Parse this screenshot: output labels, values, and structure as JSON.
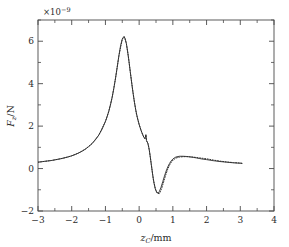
{
  "chart_data": {
    "type": "line",
    "title": "",
    "xlabel": "z_C/mm",
    "xlabel_parts": {
      "var": "z",
      "sub": "C",
      "unit": "/mm"
    },
    "ylabel": "F_z/N",
    "ylabel_parts": {
      "var": "F",
      "sub": "z",
      "unit": "/N"
    },
    "y_exponent_label": "×10⁻⁹",
    "y_exponent_parts": {
      "times": "×",
      "base": "10",
      "exp": "−9"
    },
    "xlim": [
      -3,
      4
    ],
    "ylim": [
      -2,
      7
    ],
    "xticks": [
      -3,
      -2,
      -1,
      0,
      1,
      2,
      3,
      4
    ],
    "xticklabels": [
      "−3",
      "−2",
      "−1",
      "0",
      "1",
      "2",
      "3",
      "4"
    ],
    "yticks": [
      -2,
      0,
      2,
      4,
      6
    ],
    "yticklabels": [
      "−2",
      "0",
      "2",
      "4",
      "6"
    ],
    "x_minor_ticks": [
      -2.5,
      -1.5,
      -0.5,
      0.5,
      1.5,
      2.5,
      3.5
    ],
    "y_minor_ticks": [
      -1,
      1,
      3,
      5,
      7
    ],
    "grid": false,
    "legend": "none",
    "annotations": [
      {
        "text": "small V-shaped notch artifact on descending branch",
        "x": 0.2,
        "y": 1.45
      }
    ],
    "series": [
      {
        "name": "solid",
        "style": "solid",
        "color": "#3a3a3a",
        "x": [
          -3.0,
          -2.9,
          -2.8,
          -2.7,
          -2.6,
          -2.5,
          -2.4,
          -2.3,
          -2.2,
          -2.1,
          -2.0,
          -1.9,
          -1.8,
          -1.7,
          -1.6,
          -1.5,
          -1.4,
          -1.3,
          -1.2,
          -1.1,
          -1.0,
          -0.95,
          -0.9,
          -0.85,
          -0.8,
          -0.75,
          -0.7,
          -0.65,
          -0.6,
          -0.55,
          -0.5,
          -0.46,
          -0.42,
          -0.38,
          -0.34,
          -0.3,
          -0.26,
          -0.22,
          -0.18,
          -0.14,
          -0.1,
          -0.05,
          0.0,
          0.05,
          0.1,
          0.14,
          0.17,
          0.19,
          0.2,
          0.21,
          0.22,
          0.24,
          0.26,
          0.28,
          0.3,
          0.33,
          0.36,
          0.4,
          0.44,
          0.48,
          0.52,
          0.56,
          0.6,
          0.65,
          0.7,
          0.75,
          0.8,
          0.85,
          0.9,
          0.95,
          1.0,
          1.05,
          1.1,
          1.2,
          1.3,
          1.4,
          1.5,
          1.6,
          1.7,
          1.8,
          1.9,
          2.0,
          2.2,
          2.4,
          2.6,
          2.8,
          3.0,
          3.05
        ],
        "y": [
          0.3,
          0.32,
          0.34,
          0.36,
          0.38,
          0.41,
          0.44,
          0.47,
          0.51,
          0.55,
          0.6,
          0.66,
          0.73,
          0.81,
          0.91,
          1.03,
          1.17,
          1.35,
          1.57,
          1.85,
          2.22,
          2.44,
          2.7,
          3.0,
          3.36,
          3.78,
          4.26,
          4.78,
          5.32,
          5.8,
          6.1,
          6.21,
          6.15,
          5.9,
          5.5,
          5.03,
          4.52,
          4.02,
          3.55,
          3.13,
          2.76,
          2.38,
          2.08,
          1.82,
          1.62,
          1.47,
          1.4,
          1.52,
          1.6,
          1.44,
          1.32,
          1.26,
          1.18,
          1.05,
          0.88,
          0.56,
          0.2,
          -0.28,
          -0.68,
          -0.97,
          -1.12,
          -1.15,
          -1.08,
          -0.88,
          -0.62,
          -0.36,
          -0.12,
          0.08,
          0.24,
          0.36,
          0.45,
          0.51,
          0.55,
          0.58,
          0.58,
          0.57,
          0.55,
          0.53,
          0.5,
          0.47,
          0.44,
          0.42,
          0.37,
          0.33,
          0.3,
          0.27,
          0.25,
          0.24
        ]
      },
      {
        "name": "dotted",
        "style": "dotted",
        "color": "#2b2b2b",
        "x": [
          -3.0,
          -2.8,
          -2.6,
          -2.4,
          -2.2,
          -2.0,
          -1.8,
          -1.6,
          -1.4,
          -1.2,
          -1.0,
          -0.9,
          -0.8,
          -0.7,
          -0.6,
          -0.5,
          -0.44,
          -0.38,
          -0.32,
          -0.26,
          -0.2,
          -0.14,
          -0.08,
          0.0,
          0.08,
          0.14,
          0.18,
          0.2,
          0.22,
          0.26,
          0.3,
          0.36,
          0.42,
          0.48,
          0.54,
          0.6,
          0.66,
          0.72,
          0.78,
          0.84,
          0.9,
          0.96,
          1.02,
          1.1,
          1.2,
          1.3,
          1.45,
          1.6,
          1.8,
          2.0,
          2.2,
          2.4,
          2.6,
          2.8,
          3.0,
          3.05
        ],
        "y": [
          0.3,
          0.34,
          0.38,
          0.44,
          0.51,
          0.6,
          0.73,
          0.91,
          1.17,
          1.57,
          2.22,
          2.7,
          3.36,
          4.26,
          5.32,
          6.1,
          6.22,
          5.9,
          5.28,
          4.52,
          3.8,
          3.13,
          2.56,
          2.08,
          1.7,
          1.47,
          1.42,
          1.58,
          1.3,
          1.18,
          0.88,
          0.2,
          -0.5,
          -0.95,
          -1.17,
          -1.18,
          -0.98,
          -0.66,
          -0.34,
          -0.06,
          0.16,
          0.32,
          0.42,
          0.5,
          0.54,
          0.56,
          0.56,
          0.54,
          0.5,
          0.46,
          0.4,
          0.35,
          0.31,
          0.28,
          0.26,
          0.25
        ]
      }
    ]
  },
  "figure": {
    "frame_color": "#4a4a4a",
    "background": "#ffffff"
  }
}
